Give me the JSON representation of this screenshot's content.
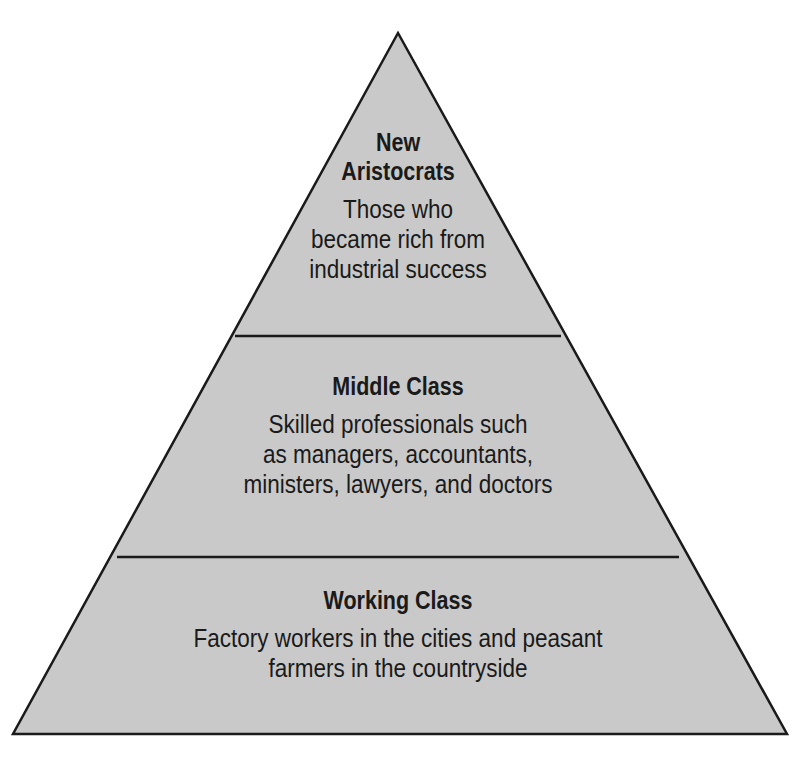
{
  "diagram": {
    "type": "pyramid",
    "colors": {
      "fill": "#c9c9c9",
      "stroke": "#1a1a1a",
      "text": "#1a1a1a",
      "background": "#ffffff"
    },
    "tiers": [
      {
        "position": "top",
        "title": "New\nAristocrats",
        "title_lines": [
          "New",
          "Aristocrats"
        ],
        "description": "Those who\nbecame rich from\nindustrial success"
      },
      {
        "position": "middle",
        "title": "Middle Class",
        "description": "Skilled professionals such\nas managers, accountants,\nministers, lawyers, and doctors"
      },
      {
        "position": "bottom",
        "title": "Working Class",
        "description": "Factory workers in the cities and peasant\nfarmers in the countryside"
      }
    ]
  }
}
